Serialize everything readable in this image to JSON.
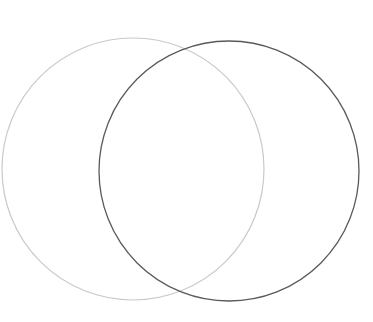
{
  "canvas": {
    "width": 373,
    "height": 322,
    "background_color": "#ffffff",
    "title": "Two overlapping circles (Venn diagram)"
  },
  "chart_data": {
    "type": "venn",
    "title": "",
    "subtitle": "",
    "xlabel": "",
    "ylabel": "",
    "grid": false,
    "legend": false,
    "legend_position": "none",
    "background_color": "#ffffff",
    "set_count": 2,
    "labels": [],
    "annotations": [],
    "intersection_points": [
      {
        "name": "upper-intersection",
        "x": 188,
        "y": 42
      },
      {
        "name": "lower-intersection",
        "x": 188,
        "y": 300
      }
    ],
    "sets": [
      {
        "name": "left-set",
        "id": "left",
        "label": "",
        "cx": 133,
        "cy": 169,
        "r": 131,
        "stroke_color": "#c9c9c9",
        "stroke_width": 1.2,
        "fill": "none",
        "bounds": {
          "left": 2,
          "right": 264,
          "top": 38,
          "bottom": 300
        }
      },
      {
        "name": "right-set",
        "id": "right",
        "label": "",
        "cx": 229,
        "cy": 171,
        "r": 130,
        "stroke_color": "#595959",
        "stroke_width": 1.3,
        "fill": "none",
        "bounds": {
          "left": 99,
          "right": 359,
          "top": 41,
          "bottom": 301
        }
      }
    ]
  }
}
